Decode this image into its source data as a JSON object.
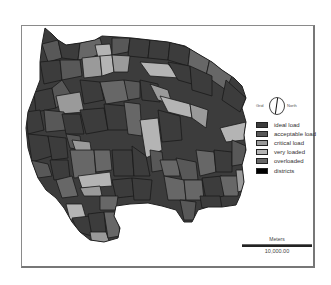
{
  "map": {
    "compass": {
      "left_label": "Grid",
      "right_label": "North",
      "icon": "north-arrow-icon"
    },
    "legend": {
      "items": [
        {
          "label": "ideal load",
          "color": "#3c3c3c"
        },
        {
          "label": "acceptable load",
          "color": "#585858"
        },
        {
          "label": "critical load",
          "color": "#9a9a9a"
        },
        {
          "label": "very loaded",
          "color": "#b4b4b4"
        },
        {
          "label": "overloaded",
          "color": "#676767"
        },
        {
          "label": "districts",
          "color": "#000000"
        }
      ]
    },
    "scale_bar": {
      "unit": "Meters",
      "distance": "10,000.00"
    }
  }
}
